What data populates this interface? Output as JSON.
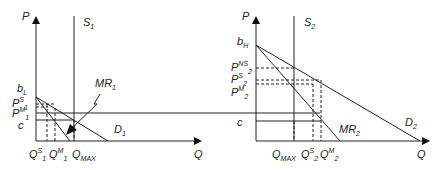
{
  "diagram": {
    "type": "economics-supply-demand",
    "colors": {
      "line": "#222222",
      "background": "#ffffff"
    },
    "left_panel": {
      "axis_y": "P",
      "axis_x": "Q",
      "supply": {
        "base": "S",
        "sub": "1"
      },
      "demand": {
        "base": "D",
        "sub": "1"
      },
      "mr": {
        "base": "MR",
        "sub": "1"
      },
      "y_labels": {
        "intercept": {
          "base": "b",
          "sub": "L"
        },
        "ps": {
          "base": "P",
          "sup": "S",
          "sub": "1"
        },
        "pm": {
          "base": "P",
          "sup": "M",
          "sub": "1"
        },
        "c": "c"
      },
      "x_labels": {
        "qs": {
          "base": "Q",
          "sup": "S",
          "sub": "1"
        },
        "qm": {
          "base": "Q",
          "sup": "M",
          "sub": "1"
        },
        "qmax": {
          "base": "Q",
          "sub": "MAX"
        }
      }
    },
    "right_panel": {
      "axis_y": "P",
      "axis_x": "Q",
      "supply": {
        "base": "S",
        "sub": "2"
      },
      "demand": {
        "base": "D",
        "sub": "2"
      },
      "mr": {
        "base": "MR",
        "sub": "2"
      },
      "y_labels": {
        "intercept": {
          "base": "b",
          "sub": "H"
        },
        "pns": {
          "base": "P",
          "sup": "NS",
          "sub": "2"
        },
        "ps": {
          "base": "P",
          "sup": "S",
          "sub": "2"
        },
        "pm": {
          "base": "P",
          "sup": "M",
          "sub": "2"
        },
        "c": "c"
      },
      "x_labels": {
        "qmax": {
          "base": "Q",
          "sub": "MAX"
        },
        "qs": {
          "base": "Q",
          "sup": "S",
          "sub": "2"
        },
        "qm": {
          "base": "Q",
          "sup": "M",
          "sub": "2"
        }
      }
    }
  }
}
